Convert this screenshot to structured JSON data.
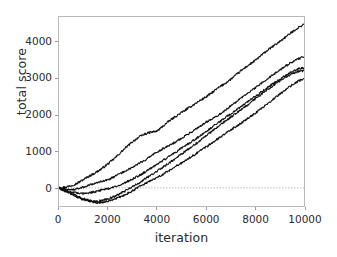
{
  "chart_data": {
    "type": "line",
    "title": "",
    "xlabel": "iteration",
    "ylabel": "total score",
    "xlim": [
      0,
      10000
    ],
    "ylim": [
      -500,
      4700
    ],
    "grid": false,
    "legend": null,
    "xticks": [
      0,
      2000,
      4000,
      6000,
      8000,
      10000
    ],
    "xtick_labels": [
      "0",
      "2000",
      "4000",
      "6000",
      "8000",
      "10000"
    ],
    "yticks": [
      0,
      1000,
      2000,
      3000,
      4000
    ],
    "ytick_labels": [
      "0",
      "1000",
      "2000",
      "3000",
      "4000"
    ],
    "zero_reference_line": {
      "y": 0,
      "style": "dotted",
      "color": "#9a9a9a"
    },
    "line_color": "#111111",
    "line_width": 1.1,
    "x": [
      0,
      250,
      500,
      750,
      1000,
      1250,
      1500,
      1750,
      2000,
      2250,
      2500,
      2750,
      3000,
      3250,
      3500,
      3750,
      4000,
      4250,
      4500,
      4750,
      5000,
      5250,
      5500,
      5750,
      6000,
      6250,
      6500,
      6750,
      7000,
      7250,
      7500,
      7750,
      8000,
      8250,
      8500,
      8750,
      9000,
      9250,
      9500,
      9750,
      10000
    ],
    "series": [
      {
        "name": "run-1",
        "values": [
          0,
          20,
          60,
          130,
          230,
          330,
          420,
          530,
          660,
          800,
          960,
          1120,
          1270,
          1390,
          1480,
          1530,
          1560,
          1700,
          1840,
          1960,
          2070,
          2180,
          2290,
          2400,
          2500,
          2620,
          2750,
          2860,
          2980,
          3120,
          3260,
          3380,
          3500,
          3640,
          3780,
          3900,
          4020,
          4150,
          4280,
          4400,
          4500
        ]
      },
      {
        "name": "run-2",
        "values": [
          0,
          -40,
          -60,
          -30,
          20,
          80,
          130,
          180,
          230,
          300,
          390,
          480,
          570,
          660,
          760,
          870,
          980,
          1080,
          1170,
          1260,
          1360,
          1470,
          1580,
          1690,
          1800,
          1900,
          2000,
          2120,
          2250,
          2380,
          2500,
          2620,
          2740,
          2870,
          3000,
          3120,
          3230,
          3350,
          3460,
          3550,
          3600
        ]
      },
      {
        "name": "run-3",
        "values": [
          0,
          -60,
          -120,
          -150,
          -160,
          -140,
          -100,
          -60,
          -20,
          30,
          90,
          160,
          240,
          330,
          430,
          540,
          650,
          760,
          870,
          980,
          1090,
          1200,
          1310,
          1430,
          1550,
          1670,
          1790,
          1910,
          2030,
          2150,
          2270,
          2390,
          2510,
          2630,
          2750,
          2870,
          2980,
          3090,
          3190,
          3270,
          3300
        ]
      },
      {
        "name": "run-4",
        "values": [
          0,
          -90,
          -180,
          -260,
          -320,
          -360,
          -380,
          -350,
          -300,
          -240,
          -160,
          -70,
          30,
          130,
          240,
          350,
          460,
          570,
          690,
          810,
          930,
          1050,
          1170,
          1300,
          1430,
          1560,
          1690,
          1820,
          1940,
          2060,
          2180,
          2310,
          2440,
          2570,
          2700,
          2820,
          2940,
          3050,
          3140,
          3200,
          3220
        ]
      },
      {
        "name": "run-5",
        "values": [
          0,
          -70,
          -150,
          -230,
          -300,
          -360,
          -400,
          -400,
          -370,
          -320,
          -250,
          -170,
          -80,
          20,
          110,
          200,
          290,
          380,
          480,
          580,
          680,
          790,
          900,
          1010,
          1120,
          1240,
          1360,
          1480,
          1590,
          1700,
          1810,
          1930,
          2050,
          2180,
          2310,
          2440,
          2570,
          2700,
          2820,
          2930,
          3000
        ]
      }
    ]
  }
}
